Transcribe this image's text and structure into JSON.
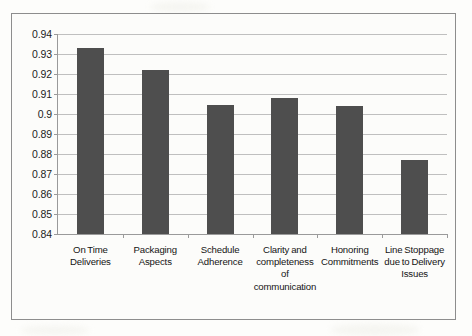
{
  "chart_data": {
    "type": "bar",
    "title": "",
    "subtitle": "",
    "xlabel": "",
    "ylabel": "",
    "categories": [
      "On Time Deliveries",
      "Packaging Aspects",
      "Schedule Adherence",
      "Clarity and completeness of communication",
      "Honoring Commitments",
      "Line Stoppage due to Delivery Issues"
    ],
    "category_lines": [
      [
        "On Time",
        "Deliveries"
      ],
      [
        "Packaging",
        "Aspects"
      ],
      [
        "Schedule",
        "Adherence"
      ],
      [
        "Clarity and",
        "completeness",
        "of",
        "communication"
      ],
      [
        "Honoring",
        "Commitments"
      ],
      [
        "Line Stoppage",
        "due to Delivery",
        "Issues"
      ]
    ],
    "values": [
      0.933,
      0.922,
      0.9045,
      0.908,
      0.9042,
      0.877
    ],
    "ylim": [
      0.84,
      0.94
    ],
    "ytick_values": [
      0.94,
      0.93,
      0.92,
      0.91,
      0.9,
      0.89,
      0.88,
      0.87,
      0.86,
      0.85,
      0.84
    ],
    "ytick_labels": [
      "0.94",
      "0.93",
      "0.92",
      "0.91",
      "0.9",
      "0.89",
      "0.88",
      "0.87",
      "0.86",
      "0.85",
      "0.84"
    ],
    "grid": true,
    "legend": false,
    "legend_position": "none",
    "bar_color": "#4e4e4e",
    "gridline_color": "#bfbfbf",
    "axis_color": "#9a9a9a",
    "background_color": "#fcfcfa",
    "frame_color": "#8d8d8d"
  }
}
